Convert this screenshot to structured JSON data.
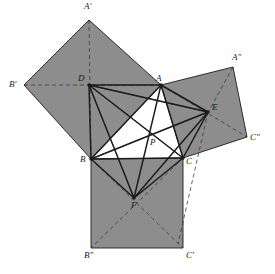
{
  "figure": {
    "caption": "",
    "canvas": {
      "width": 275,
      "height": 274,
      "background": "#ffffff"
    },
    "style": {
      "fill_gray": "#8d8d8d",
      "fill_white": "#ffffff",
      "stroke_dark": "#1b1b1b",
      "stroke_thin": "#3a3a3a",
      "dash_pattern": "4 3",
      "solid_width": 1.45,
      "thin_width": 0.7,
      "dash_width": 0.8
    },
    "points": [
      {
        "name": "A",
        "label": "A",
        "x": 161,
        "y": 85,
        "lx": 156,
        "ly": 74,
        "dot": true
      },
      {
        "name": "B",
        "label": "B",
        "x": 91,
        "y": 159,
        "lx": 80,
        "ly": 155,
        "dot": true
      },
      {
        "name": "C",
        "label": "C",
        "x": 183,
        "y": 158,
        "lx": 186,
        "ly": 157,
        "dot": true
      },
      {
        "name": "D",
        "label": "D",
        "x": 89,
        "y": 85,
        "lx": 78,
        "ly": 74,
        "dot": true
      },
      {
        "name": "E",
        "label": "E",
        "x": 208,
        "y": 112,
        "lx": 212,
        "ly": 103,
        "dot": true
      },
      {
        "name": "F",
        "label": "F",
        "x": 134,
        "y": 198,
        "lx": 131,
        "ly": 201,
        "dot": true
      },
      {
        "name": "P",
        "label": "P",
        "x": 149,
        "y": 135,
        "lx": 150,
        "ly": 138,
        "dot": false
      },
      {
        "name": "Aprime",
        "label": "A′",
        "x": 89,
        "y": 20,
        "lx": 84,
        "ly": 2,
        "dot": false
      },
      {
        "name": "Bprime",
        "label": "B′",
        "x": 24,
        "y": 85,
        "lx": 9,
        "ly": 80,
        "dot": false
      },
      {
        "name": "Adprime",
        "label": "A″",
        "x": 233,
        "y": 67,
        "lx": 232,
        "ly": 53,
        "dot": false
      },
      {
        "name": "Cdprime",
        "label": "C″",
        "x": 247,
        "y": 137,
        "lx": 250,
        "ly": 133,
        "dot": false
      },
      {
        "name": "Bdprime",
        "label": "B″",
        "x": 91,
        "y": 248,
        "lx": 84,
        "ly": 251,
        "dot": false
      },
      {
        "name": "Cprime",
        "label": "C′",
        "x": 183,
        "y": 248,
        "lx": 186,
        "ly": 251,
        "dot": false
      }
    ],
    "regions": [
      {
        "name": "square-on-AB",
        "fill": "#8d8d8d",
        "points": "89,20 161,85 91,159 24,85"
      },
      {
        "name": "square-on-AC",
        "fill": "#8d8d8d",
        "points": "161,85 233,67 247,137 183,158"
      },
      {
        "name": "square-on-BC",
        "fill": "#8d8d8d",
        "points": "91,159 183,158 183,248 91,248"
      },
      {
        "name": "inner-white-triangle",
        "fill": "#ffffff",
        "points": "161,85 91,159 183,158"
      }
    ],
    "solid_edges": [
      {
        "name": "edge-D-A",
        "x1": 89,
        "y1": 85,
        "x2": 161,
        "y2": 85
      },
      {
        "name": "edge-D-B",
        "x1": 89,
        "y1": 85,
        "x2": 91,
        "y2": 159
      },
      {
        "name": "edge-D-C",
        "x1": 89,
        "y1": 85,
        "x2": 183,
        "y2": 158
      },
      {
        "name": "edge-D-E",
        "x1": 89,
        "y1": 85,
        "x2": 208,
        "y2": 112
      },
      {
        "name": "edge-D-F",
        "x1": 89,
        "y1": 85,
        "x2": 134,
        "y2": 198
      },
      {
        "name": "edge-A-B",
        "x1": 161,
        "y1": 85,
        "x2": 91,
        "y2": 159
      },
      {
        "name": "edge-A-C",
        "x1": 161,
        "y1": 85,
        "x2": 183,
        "y2": 158
      },
      {
        "name": "edge-A-E",
        "x1": 161,
        "y1": 85,
        "x2": 208,
        "y2": 112
      },
      {
        "name": "edge-A-F",
        "x1": 161,
        "y1": 85,
        "x2": 134,
        "y2": 198
      },
      {
        "name": "edge-B-C",
        "x1": 91,
        "y1": 159,
        "x2": 183,
        "y2": 158
      },
      {
        "name": "edge-B-E",
        "x1": 91,
        "y1": 159,
        "x2": 208,
        "y2": 112
      },
      {
        "name": "edge-B-F",
        "x1": 91,
        "y1": 159,
        "x2": 134,
        "y2": 198
      },
      {
        "name": "edge-C-E",
        "x1": 183,
        "y1": 158,
        "x2": 208,
        "y2": 112
      },
      {
        "name": "edge-C-F",
        "x1": 183,
        "y1": 158,
        "x2": 134,
        "y2": 198
      },
      {
        "name": "edge-E-F",
        "x1": 208,
        "y1": 112,
        "x2": 134,
        "y2": 198
      }
    ],
    "thin_edges": [
      {
        "name": "thin-D-C",
        "x1": 89,
        "y1": 85,
        "x2": 183,
        "y2": 158
      },
      {
        "name": "thin-D-E",
        "x1": 89,
        "y1": 85,
        "x2": 208,
        "y2": 112
      },
      {
        "name": "thin-D-F",
        "x1": 89,
        "y1": 85,
        "x2": 134,
        "y2": 198
      },
      {
        "name": "thin-A-E",
        "x1": 161,
        "y1": 85,
        "x2": 208,
        "y2": 112
      },
      {
        "name": "thin-B-E",
        "x1": 91,
        "y1": 159,
        "x2": 208,
        "y2": 112
      }
    ],
    "square-outlines": [
      {
        "name": "outline-square-AB",
        "points": "89,20 161,85 91,159 24,85"
      },
      {
        "name": "outline-square-AC",
        "points": "161,85 233,67 247,137 183,158"
      },
      {
        "name": "outline-square-BC",
        "points": "91,159 183,158 183,248 91,248"
      }
    ],
    "dashed_edges": [
      {
        "name": "dash-Aprime-B",
        "x1": 89,
        "y1": 20,
        "x2": 91,
        "y2": 159
      },
      {
        "name": "dash-Bprime-A",
        "x1": 24,
        "y1": 85,
        "x2": 161,
        "y2": 85
      },
      {
        "name": "dash-Adprime-C",
        "x1": 233,
        "y1": 67,
        "x2": 183,
        "y2": 158
      },
      {
        "name": "dash-A-Cdprime",
        "x1": 161,
        "y1": 85,
        "x2": 247,
        "y2": 137
      },
      {
        "name": "dash-B-Cprime",
        "x1": 91,
        "y1": 159,
        "x2": 183,
        "y2": 248
      },
      {
        "name": "dash-C-Bdprime",
        "x1": 183,
        "y1": 158,
        "x2": 91,
        "y2": 248
      },
      {
        "name": "dash-E-Cprime",
        "x1": 208,
        "y1": 112,
        "x2": 178,
        "y2": 244
      }
    ]
  }
}
